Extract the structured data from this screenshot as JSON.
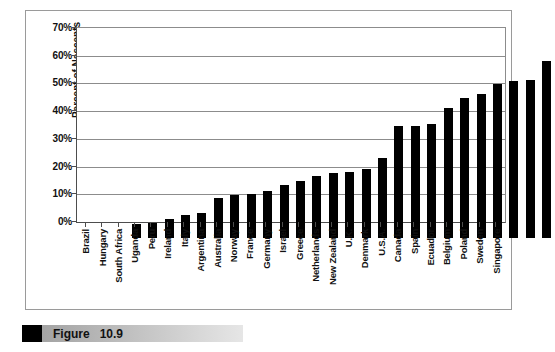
{
  "figure": {
    "caption_label": "Figure",
    "caption_number": "10.9",
    "caption_text": "Figure   10.9"
  },
  "chart_data": {
    "type": "bar",
    "title": "",
    "subtitle": "",
    "xlabel": "",
    "ylabel": "Percent of Nascents",
    "ylim": [
      0,
      70
    ],
    "ytick_labels": [
      "70%",
      "60%",
      "50%",
      "40%",
      "30%",
      "20%",
      "10%",
      "0%"
    ],
    "ytick_values": [
      70,
      60,
      50,
      40,
      30,
      20,
      10,
      0
    ],
    "grid": true,
    "legend": false,
    "bar_color": "#000000",
    "categories": [
      "Brazil",
      "Hungary",
      "South Africa",
      "Uganda",
      "Peru",
      "Ireland",
      "Italy",
      "Argentina",
      "Australia",
      "Norway",
      "France",
      "Germany",
      "Israel",
      "Greece",
      "Netherlands",
      "New Zealand",
      "U.K.",
      "Denmark",
      "U.S.A.",
      "Canada",
      "Spain",
      "Ecuador",
      "Belgium",
      "Poland",
      "Sweden",
      "Singapore"
    ],
    "values": [
      5.0,
      5.3,
      7.0,
      8.2,
      9.1,
      14.5,
      15.5,
      15.8,
      17.0,
      19.3,
      20.5,
      22.5,
      23.3,
      24.0,
      25.0,
      29.0,
      40.5,
      40.5,
      41.0,
      47.0,
      50.5,
      52.0,
      55.5,
      56.5,
      57.0,
      64.0
    ]
  },
  "colors": {
    "bar": "#000000",
    "gridline": "#8c8c8c",
    "axis": "#4d4d4d",
    "frame": "#9a9a9a",
    "caption_marker": "#000000"
  }
}
